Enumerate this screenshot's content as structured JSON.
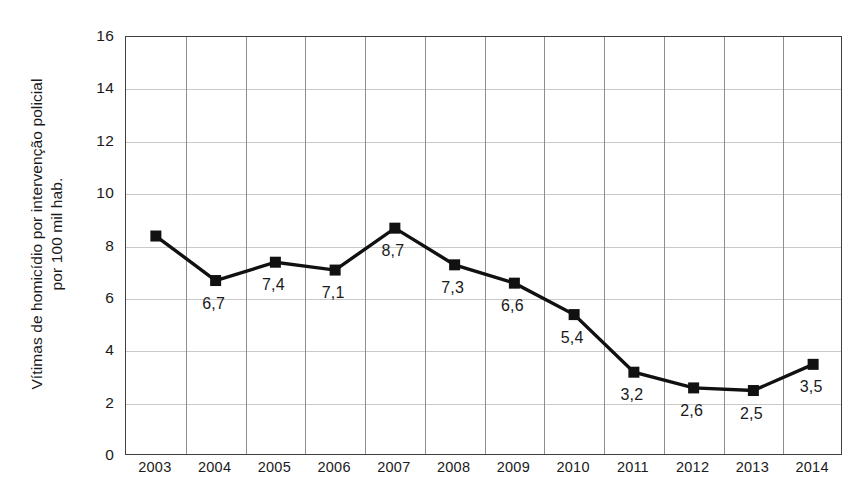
{
  "chart_data": {
    "type": "line",
    "title": "",
    "subtitle": "",
    "xlabel": "",
    "ylabel": "Vítimas de homicídio por intervenção policial por 100 mil hab.",
    "ylabel_line1": "Vítimas de homicídio por intervenção policial",
    "ylabel_line2": "por 100 mil hab.",
    "categories": [
      "2003",
      "2004",
      "2005",
      "2006",
      "2007",
      "2008",
      "2009",
      "2010",
      "2011",
      "2012",
      "2013",
      "2014"
    ],
    "values": [
      8.4,
      6.7,
      7.4,
      7.1,
      8.7,
      7.3,
      6.6,
      5.4,
      3.2,
      2.6,
      2.5,
      3.5
    ],
    "point_labels": [
      "",
      "6,7",
      "7,4",
      "7,1",
      "8,7",
      "7,3",
      "6,6",
      "5,4",
      "3,2",
      "2,6",
      "2,5",
      "3,5"
    ],
    "ylim": [
      0,
      16
    ],
    "ytick_values": [
      0,
      2,
      4,
      6,
      8,
      10,
      12,
      14,
      16
    ],
    "ytick_labels": [
      "0",
      "2",
      "4",
      "6",
      "8",
      "10",
      "12",
      "14",
      "16"
    ],
    "grid": true,
    "grid_horizontal": true,
    "grid_vertical": true,
    "legend": false,
    "legend_position": "none",
    "decimal_separator": ",",
    "marker": "square",
    "colors": {
      "line": "#111111",
      "marker": "#111111",
      "grid_horizontal": "#c9c9c9",
      "grid_vertical": "#8e8e8e",
      "frame": "#3f3f3f",
      "text": "#1a1a1a",
      "background": "#ffffff"
    }
  }
}
